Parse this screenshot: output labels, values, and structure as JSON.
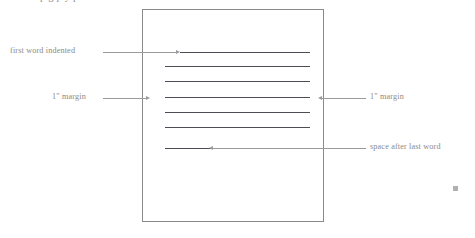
{
  "figure": {
    "top_cropped_text": "p g p   y p",
    "speck_label": "stray-mark"
  },
  "page": {
    "name": "manuscript-page",
    "lines": [
      {
        "id": "line-1",
        "note": "indented first line",
        "x": 180,
        "y": 52,
        "width": 130
      },
      {
        "id": "line-2",
        "note": "full width",
        "x": 165,
        "y": 66,
        "width": 145
      },
      {
        "id": "line-3",
        "note": "full width",
        "x": 165,
        "y": 81,
        "width": 145
      },
      {
        "id": "line-4",
        "note": "full width",
        "x": 165,
        "y": 97,
        "width": 145
      },
      {
        "id": "line-5",
        "note": "full width",
        "x": 165,
        "y": 112,
        "width": 145
      },
      {
        "id": "line-6",
        "note": "full width",
        "x": 165,
        "y": 127,
        "width": 145
      },
      {
        "id": "line-7",
        "note": "short last line",
        "x": 165,
        "y": 148,
        "width": 47
      }
    ]
  },
  "annotations": [
    {
      "id": "first-word-indented",
      "text": "first word indented",
      "side": "left",
      "label_x": 10,
      "label_y": 46,
      "leader_x": 103,
      "leader_y": 52,
      "leader_width": 73,
      "arrow": "right"
    },
    {
      "id": "left-margin",
      "text": "1\" margin",
      "side": "left",
      "label_x": 52,
      "label_y": 92,
      "leader_x": 103,
      "leader_y": 98,
      "leader_width": 43,
      "arrow": "right"
    },
    {
      "id": "right-margin",
      "text": "1\" margin",
      "side": "right",
      "label_x": 370,
      "label_y": 92,
      "leader_x": 322,
      "leader_y": 98,
      "leader_width": 44,
      "arrow": "left"
    },
    {
      "id": "space-after-last-word",
      "text": "space after last word",
      "side": "right",
      "label_x": 370,
      "label_y": 142,
      "leader_x": 213,
      "leader_y": 148,
      "leader_width": 153,
      "arrow": "left"
    }
  ],
  "colors": {
    "page_border": "#8a8a8a",
    "text_line": "#4d4d55",
    "annotation": "#8a8a8a",
    "leader": "#9a9a9a",
    "background": "#ffffff"
  }
}
